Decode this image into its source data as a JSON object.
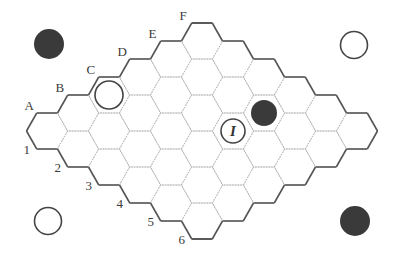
{
  "board": {
    "size": 6,
    "letters": [
      "A",
      "B",
      "C",
      "D",
      "E",
      "F"
    ],
    "numbers": [
      "1",
      "2",
      "3",
      "4",
      "5",
      "6"
    ],
    "origin": [
      47,
      131
    ],
    "step_x": 31,
    "step_y": 18,
    "hex_radius": 20.5,
    "hex_half_height": 18,
    "colors": {
      "edge": "#555555",
      "grid": "#b8b8b8",
      "black": "#3a3a3a",
      "white": "#ffffff"
    }
  },
  "pieces": [
    {
      "cell": "C1",
      "color": "white",
      "label": ""
    },
    {
      "cell": "E4",
      "color": "black",
      "label": ""
    },
    {
      "cell": "D4",
      "color": "white",
      "label": "I",
      "marker": true
    }
  ],
  "corner_stones": [
    {
      "position": "top-left",
      "color": "black",
      "x": 49,
      "y": 44
    },
    {
      "position": "top-right",
      "color": "white",
      "x": 354,
      "y": 45
    },
    {
      "position": "bottom-left",
      "color": "white",
      "x": 48,
      "y": 221
    },
    {
      "position": "bottom-right",
      "color": "black",
      "x": 355,
      "y": 221
    }
  ]
}
